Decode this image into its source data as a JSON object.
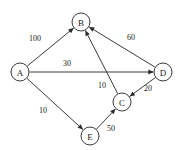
{
  "figure": {
    "kind": "directed-weighted-graph",
    "background_color": "#ffffff",
    "stroke_color": "#3a3a3a",
    "text_color": "#1a1a1a"
  },
  "nodes": [
    {
      "id": "A",
      "label": "A",
      "cx": 20,
      "cy": 72,
      "r": 9
    },
    {
      "id": "B",
      "label": "B",
      "cx": 81,
      "cy": 22,
      "r": 9
    },
    {
      "id": "C",
      "label": "C",
      "cx": 122,
      "cy": 102,
      "r": 9
    },
    {
      "id": "D",
      "label": "D",
      "cx": 163,
      "cy": 72,
      "r": 9
    },
    {
      "id": "E",
      "label": "E",
      "cx": 90,
      "cy": 136,
      "r": 9
    }
  ],
  "edges": [
    {
      "id": "A-B",
      "from": "A",
      "to": "B",
      "weight": "100",
      "label_x": 35,
      "label_y": 38
    },
    {
      "id": "A-D",
      "from": "A",
      "to": "D",
      "weight": "30",
      "label_x": 67,
      "label_y": 63
    },
    {
      "id": "A-E",
      "from": "A",
      "to": "E",
      "weight": "10",
      "label_x": 43,
      "label_y": 110
    },
    {
      "id": "D-B",
      "from": "D",
      "to": "B",
      "weight": "60",
      "label_x": 131,
      "label_y": 37
    },
    {
      "id": "D-C",
      "from": "D",
      "to": "C",
      "weight": "20",
      "label_x": 148,
      "label_y": 88
    },
    {
      "id": "C-B",
      "from": "C",
      "to": "B",
      "weight": "10",
      "label_x": 102,
      "label_y": 85
    },
    {
      "id": "E-C",
      "from": "E",
      "to": "C",
      "weight": "50",
      "label_x": 111,
      "label_y": 128
    }
  ]
}
